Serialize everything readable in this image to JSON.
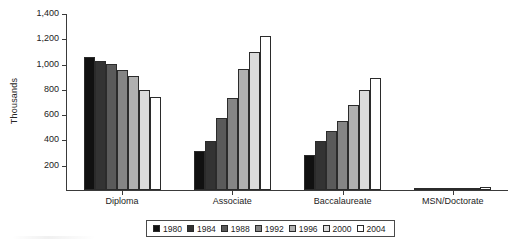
{
  "chart_data": {
    "type": "bar",
    "title": "",
    "subtitle": "",
    "xlabel": "",
    "ylabel": "Thousands",
    "ylim": [
      0,
      1400
    ],
    "ytick_step": 200,
    "yticks": [
      1400,
      1200,
      1000,
      800,
      600,
      400,
      200
    ],
    "ytick_labels": [
      "1,400",
      "1,200",
      "1,000",
      "800",
      "600",
      "400",
      "200"
    ],
    "grid": false,
    "legend_position": "bottom",
    "categories": [
      "Diploma",
      "Associate",
      "Baccalaureate",
      "MSN/Doctorate"
    ],
    "series": [
      {
        "name": "1980",
        "color": "#111111",
        "values": [
          1055,
          305,
          275,
          3
        ]
      },
      {
        "name": "1984",
        "color": "#333333",
        "values": [
          1020,
          390,
          390,
          5
        ]
      },
      {
        "name": "1988",
        "color": "#5a5a5a",
        "values": [
          995,
          570,
          465,
          7
        ]
      },
      {
        "name": "1992",
        "color": "#858585",
        "values": [
          950,
          725,
          545,
          9
        ]
      },
      {
        "name": "1996",
        "color": "#b0b0b0",
        "values": [
          905,
          955,
          670,
          12
        ]
      },
      {
        "name": "2000",
        "color": "#dcdcdc",
        "values": [
          790,
          1095,
          790,
          16
        ]
      },
      {
        "name": "2004",
        "color": "#ffffff",
        "values": [
          735,
          1220,
          885,
          22
        ]
      }
    ]
  },
  "legend": {
    "items": [
      {
        "label": "1980"
      },
      {
        "label": "1984"
      },
      {
        "label": "1988"
      },
      {
        "label": "1992"
      },
      {
        "label": "1996"
      },
      {
        "label": "2000"
      },
      {
        "label": "2004"
      }
    ]
  }
}
